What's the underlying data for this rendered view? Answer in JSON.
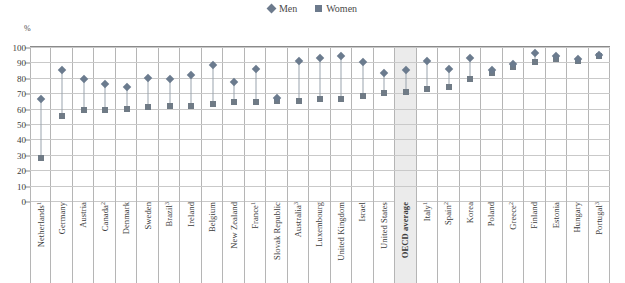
{
  "chart_data": {
    "type": "scatter",
    "title": "",
    "xlabel": "",
    "ylabel": "%",
    "ylim": [
      0,
      100
    ],
    "ytick_step": 10,
    "yticks": [
      0,
      10,
      20,
      30,
      40,
      50,
      60,
      70,
      80,
      90,
      100
    ],
    "grid": true,
    "legend_position": "top-center",
    "highlight_category": "OECD average",
    "categories": [
      "Netherlands",
      "Germany",
      "Austria",
      "Canada",
      "Denmark",
      "Sweden",
      "Brazil",
      "Ireland",
      "Belgium",
      "New Zealand",
      "France",
      "Slovak Republic",
      "Australia",
      "Luxembourg",
      "United Kingdom",
      "Israel",
      "United States",
      "OECD average",
      "Italy",
      "Spain",
      "Korea",
      "Poland",
      "Greece",
      "Finland",
      "Estonia",
      "Hungary",
      "Portugal"
    ],
    "category_footnotes": [
      "1",
      "",
      "",
      "2",
      "",
      "",
      "3",
      "",
      "",
      "",
      "1",
      "",
      "3",
      "",
      "",
      "",
      "",
      "",
      "1",
      "2",
      "",
      "",
      "2",
      "",
      "",
      "",
      "3"
    ],
    "series": [
      {
        "name": "Men",
        "marker": "diamond",
        "color": "#6b7b8e",
        "values": [
          66,
          85,
          79,
          76,
          74,
          80,
          79,
          82,
          88,
          77,
          86,
          67,
          91,
          93,
          94,
          90,
          83,
          85,
          91,
          86,
          93,
          85,
          89,
          96,
          94,
          92,
          95
        ]
      },
      {
        "name": "Women",
        "marker": "square",
        "color": "#707b86",
        "values": [
          28,
          55,
          59,
          59,
          60,
          61,
          62,
          62,
          63,
          64,
          64,
          65,
          65,
          66,
          66,
          68,
          70,
          71,
          73,
          74,
          79,
          83,
          87,
          90,
          92,
          91,
          94
        ]
      }
    ]
  },
  "legend": {
    "items": [
      {
        "label": "Men",
        "marker": "diamond"
      },
      {
        "label": "Women",
        "marker": "square"
      }
    ]
  },
  "axis": {
    "unit_label": "%"
  }
}
